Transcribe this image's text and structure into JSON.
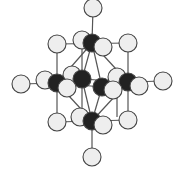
{
  "diagram": {
    "title": "",
    "style": {
      "bond_color": "#555555",
      "white_atom_fill": "#eeeeee",
      "white_atom_stroke": "#444444",
      "black_atom_fill": "#222222",
      "background": "#ffffff"
    },
    "white_atom_radius": 9,
    "black_atom_radius": 9,
    "bonds": [
      [
        93,
        8,
        92,
        43
      ],
      [
        92,
        121,
        92,
        157
      ],
      [
        21,
        84,
        57,
        83
      ],
      [
        128,
        82,
        163,
        81
      ],
      [
        57,
        44,
        128,
        43
      ],
      [
        57,
        122,
        128,
        120
      ],
      [
        57,
        44,
        57,
        122
      ],
      [
        128,
        43,
        128,
        120
      ],
      [
        82,
        40,
        82,
        117
      ],
      [
        117,
        77,
        117,
        117
      ],
      [
        92,
        43,
        57,
        83
      ],
      [
        92,
        43,
        82,
        79
      ],
      [
        92,
        43,
        102,
        87
      ],
      [
        92,
        43,
        128,
        82
      ],
      [
        92,
        121,
        57,
        83
      ],
      [
        92,
        121,
        82,
        79
      ],
      [
        92,
        121,
        102,
        87
      ],
      [
        92,
        121,
        128,
        82
      ],
      [
        57,
        83,
        82,
        79
      ],
      [
        82,
        79,
        128,
        82
      ],
      [
        57,
        83,
        102,
        87
      ],
      [
        102,
        87,
        128,
        82
      ]
    ],
    "atoms_back": [
      {
        "type": "white",
        "x": 93,
        "y": 8
      },
      {
        "type": "white",
        "x": 57,
        "y": 44
      },
      {
        "type": "white",
        "x": 128,
        "y": 43
      },
      {
        "type": "white",
        "x": 82,
        "y": 40
      },
      {
        "type": "white",
        "x": 21,
        "y": 84
      },
      {
        "type": "white",
        "x": 45,
        "y": 80
      },
      {
        "type": "white",
        "x": 72,
        "y": 75
      },
      {
        "type": "white",
        "x": 117,
        "y": 77
      },
      {
        "type": "white",
        "x": 163,
        "y": 81
      },
      {
        "type": "white",
        "x": 57,
        "y": 122
      },
      {
        "type": "white",
        "x": 128,
        "y": 120
      },
      {
        "type": "white",
        "x": 80,
        "y": 117
      },
      {
        "type": "white",
        "x": 92,
        "y": 157
      }
    ],
    "atoms_black": [
      {
        "type": "black",
        "x": 92,
        "y": 43
      },
      {
        "type": "black",
        "x": 57,
        "y": 83
      },
      {
        "type": "black",
        "x": 82,
        "y": 79
      },
      {
        "type": "black",
        "x": 102,
        "y": 87
      },
      {
        "type": "black",
        "x": 128,
        "y": 82
      },
      {
        "type": "black",
        "x": 92,
        "y": 121
      }
    ],
    "atoms_front": [
      {
        "type": "white",
        "x": 103,
        "y": 47
      },
      {
        "type": "white",
        "x": 67,
        "y": 88
      },
      {
        "type": "white",
        "x": 113,
        "y": 90
      },
      {
        "type": "white",
        "x": 139,
        "y": 86
      },
      {
        "type": "white",
        "x": 103,
        "y": 125
      }
    ]
  }
}
